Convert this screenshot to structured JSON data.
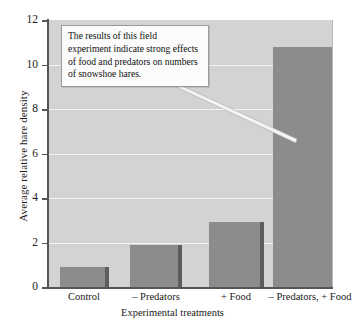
{
  "chart_data": {
    "type": "bar",
    "title": "",
    "categories": [
      "Control",
      "– Predators",
      "+ Food",
      "– Predators, + Food"
    ],
    "values": [
      0.9,
      1.9,
      2.9,
      10.8
    ],
    "xlabel": "Experimental treatments",
    "ylabel": "Average relative hare density",
    "ylim": [
      0,
      12
    ],
    "ytick_labels": [
      "0",
      "2",
      "4",
      "6",
      "8",
      "10",
      "12"
    ],
    "ytick_values": [
      0,
      2,
      4,
      6,
      8,
      10,
      12
    ],
    "grid": true,
    "legend": "none",
    "annotations": [
      {
        "text": "The results of this field experiment indicate strong effects of food and predators on numbers of snowshoe hares.",
        "points_to": "– Predators, + Food"
      }
    ],
    "colors": {
      "bar": "#8c8c8c",
      "bar_shadow": "#5d5d5d",
      "plot_background": "#d3d3d3",
      "gridline": "#f2f2f2",
      "axis": "#555555",
      "callout_background": "#fbfbfb",
      "callout_border": "#9a9a9a",
      "text": "#1a1a1a"
    }
  },
  "figure": {
    "caption_remnant": ""
  }
}
